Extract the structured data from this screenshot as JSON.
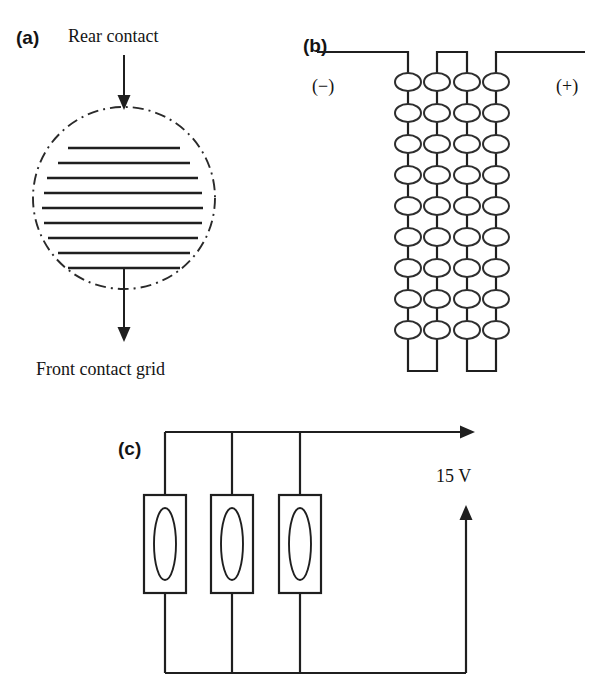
{
  "figure": {
    "background_color": "#ffffff",
    "ink_color": "#1f1f1f",
    "width": 612,
    "height": 699
  },
  "panel_a": {
    "tag": "(a)",
    "top_label": "Rear contact",
    "bottom_label": "Front contact grid",
    "wafer": {
      "shape": "circle",
      "outline_style": "dash-dot",
      "center_x": 124,
      "center_y": 198,
      "radius": 91
    },
    "grid_finger_count": 9,
    "grid_fingers": [
      {
        "y": 148,
        "x1": 68,
        "x2": 180
      },
      {
        "y": 163,
        "x1": 58,
        "x2": 190
      },
      {
        "y": 178,
        "x1": 47,
        "x2": 198
      },
      {
        "y": 193,
        "x1": 44,
        "x2": 202
      },
      {
        "y": 208,
        "x1": 42,
        "x2": 203
      },
      {
        "y": 223,
        "x1": 44,
        "x2": 202
      },
      {
        "y": 238,
        "x1": 48,
        "x2": 198
      },
      {
        "y": 253,
        "x1": 58,
        "x2": 190
      },
      {
        "y": 268,
        "x1": 68,
        "x2": 180
      }
    ],
    "top_arrow": {
      "x": 124,
      "y_start": 55,
      "y_end": 107,
      "direction": "down"
    },
    "bottom_arrow": {
      "x": 124,
      "y_start": 268,
      "y_end": 340,
      "direction": "down"
    }
  },
  "panel_b": {
    "tag": "(b)",
    "negative_terminal_label": "(−)",
    "positive_terminal_label": "(+)",
    "column_count": 4,
    "cells_per_column": 9,
    "total_cells": 36,
    "column_x": [
      408,
      437,
      467,
      496
    ],
    "cell_start_y": 82,
    "cell_spacing_y": 31,
    "cell_width": 26,
    "cell_height": 18,
    "top_bus_y": 52,
    "bottom_bus_y": 371,
    "negative_lead_x_start": 317,
    "positive_lead_x_end": 585,
    "series_string_description": "serpentine series string: (−) lead → column 1 down, bridged at bottom to column 2 up, bridged at top to column 3 down, bridged at bottom to column 4 up → (+) lead"
  },
  "panel_c": {
    "tag": "(c)",
    "voltage_label": "15 V",
    "module_count": 3,
    "module_x": [
      165,
      232,
      300
    ],
    "module_top_y": 495,
    "module_width": 42,
    "module_height": 98,
    "inner_cell_rx": 11,
    "inner_cell_ry": 36,
    "top_rail_y": 432,
    "bottom_rail_y": 673,
    "right_rail_x": 466,
    "output_arrow_x_end": 475,
    "connection": "parallel",
    "arrows": [
      {
        "name": "output-current-arrow",
        "orientation": "horizontal",
        "direction": "right"
      },
      {
        "name": "return-current-arrow",
        "orientation": "vertical",
        "direction": "up"
      }
    ]
  }
}
